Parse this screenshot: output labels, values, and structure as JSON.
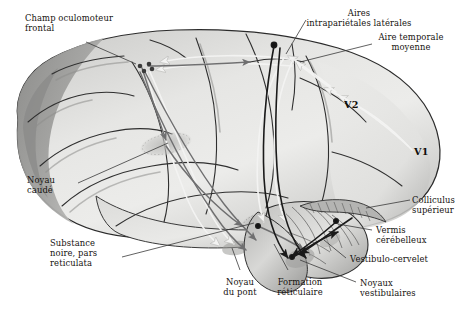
{
  "figure": {
    "background_color": "#ffffff",
    "width": 457,
    "height": 312
  },
  "labels": {
    "frontal_eye_field": "Champ oculomoteur\nfrontal",
    "lateral_intraparietal": "Aires\nintrapariétales latérales",
    "middle_temporal": "Aire temporale\nmoyenne",
    "caudate_nucleus": "Noyau\ncaudé",
    "substantia_nigra": "Substance\nnoire, pars\nreticulata",
    "pontine_nucleus": "Noyau\ndu pont",
    "reticular_formation": "Formation\nréticulaire",
    "superior_colliculus": "Colliculus\nsupérieur",
    "cerebellar_vermis": "Vermis\ncérébelleux",
    "vestibulocerebellum": "Vestibulo-cervelet",
    "vestibular_nuclei": "Noyaux\nvestibulaires"
  },
  "area_markers": {
    "v1": "V1",
    "v2": "V2"
  },
  "colors": {
    "brain_light": "#e7e7e6",
    "brain_mid": "#cfcfcd",
    "brain_dark": "#9d9d9b",
    "brain_darkest": "#7e7e7c",
    "outline": "#2b2b2b",
    "pathway_dark": "#1a1a1a",
    "pathway_gray": "#6f6f70",
    "pathway_light": "#f2f2f1",
    "label_text": "#15120f",
    "leader_line": "#3a3a3a"
  }
}
